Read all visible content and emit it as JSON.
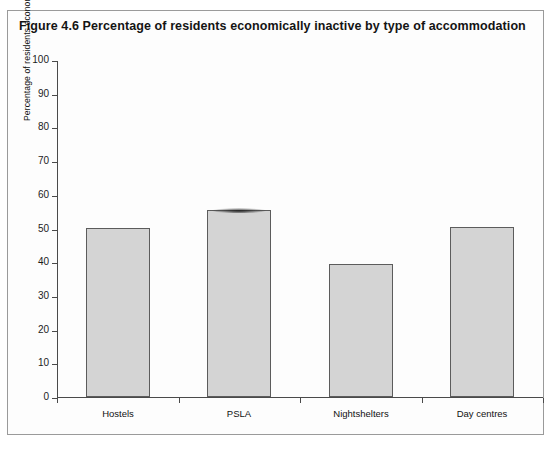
{
  "figure": {
    "title": "Figure 4.6  Percentage of  residents economically inactive by type of accommodation"
  },
  "chart_data": {
    "type": "bar",
    "title": "Figure 4.6  Percentage of  residents economically inactive by type of accommodation",
    "xlabel": "",
    "ylabel": "Percentage of residents economically inactive",
    "categories": [
      "Hostels",
      "PSLA",
      "Nightshelters",
      "Day centres"
    ],
    "values": [
      50.0,
      55.5,
      39.5,
      50.5
    ],
    "ylim": [
      0,
      100
    ],
    "yticks": [
      0,
      10,
      20,
      30,
      40,
      50,
      60,
      70,
      80,
      90,
      100
    ],
    "ytick_labels": [
      "0",
      "10",
      "20",
      "30",
      "40",
      "50",
      "60",
      "70",
      "80",
      "90",
      "100"
    ],
    "grid": false,
    "legend": false,
    "bar_fill_color": "#d4d4d4",
    "bar_edge_color": "#5c5c5c",
    "axis_color": "#4a4a4a"
  }
}
